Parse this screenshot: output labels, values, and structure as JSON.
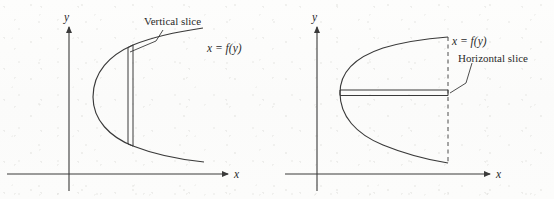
{
  "figure": {
    "name": "vertical-and-horizontal-slice-diagram",
    "ink_color": "#3a3a3a",
    "text_color": "#2a2a2a",
    "background_color": "#fdfdfc",
    "panels": [
      {
        "id": "left-panel",
        "axis_x_label": "x",
        "axis_y_label": "y",
        "curve_label": "x = f(y)",
        "slice_label": "Vertical slice",
        "slice_orientation": "vertical",
        "has_dashed_guide": false
      },
      {
        "id": "right-panel",
        "axis_x_label": "x",
        "axis_y_label": "y",
        "curve_label": "x = f(y)",
        "slice_label": "Horizontal slice",
        "slice_orientation": "horizontal",
        "has_dashed_guide": true
      }
    ]
  }
}
